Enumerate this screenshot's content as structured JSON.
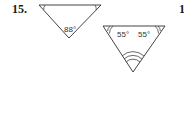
{
  "problem": {
    "number": "15.",
    "next_number_partial": "1"
  },
  "figures": [
    {
      "name": "triangle-1",
      "angles": [
        {
          "position": "bottom",
          "label": "88°"
        },
        {
          "position": "top-left",
          "label": "",
          "arcs": 1
        },
        {
          "position": "top-right",
          "label": "",
          "arcs": 1
        }
      ]
    },
    {
      "name": "triangle-2",
      "angles": [
        {
          "position": "top-left",
          "label": "55°",
          "arcs": 2
        },
        {
          "position": "top-right",
          "label": "55°",
          "arcs": 2
        },
        {
          "position": "bottom",
          "label": "",
          "arcs": 3
        }
      ]
    }
  ]
}
